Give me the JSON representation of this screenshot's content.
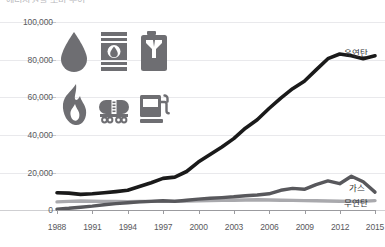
{
  "title_truncated": "에너지원별 소비 추이",
  "yaxis": {
    "ticks": [
      "100,000",
      "80,000",
      "60,000",
      "40,000",
      "20,000",
      "0"
    ],
    "values": [
      100000,
      80000,
      60000,
      40000,
      20000,
      0
    ]
  },
  "xaxis": {
    "ticks": [
      "1988",
      "1991",
      "1994",
      "1997",
      "2000",
      "2003",
      "2006",
      "2009",
      "2012",
      "2015"
    ]
  },
  "legend": {
    "bituminous": "유연탄",
    "gas": "가스",
    "anthracite": "무연탄"
  },
  "colors": {
    "bituminous": "#1a1a1a",
    "gas": "#58585c",
    "anthracite": "#a9a9ad",
    "grid": "#e9e9ec",
    "axis": "#9b9b9f",
    "icon": "#6e6e72",
    "text": "#59595d"
  },
  "icons": {
    "row1": [
      "oil-droplet-icon",
      "oil-barrel-icon",
      "jerry-can-icon"
    ],
    "row2": [
      "flame-icon",
      "tanker-truck-icon",
      "fuel-pump-icon"
    ]
  },
  "chart_data": {
    "type": "line",
    "title": "에너지원별 소비 추이",
    "xlabel": "",
    "ylabel": "",
    "xlim": [
      1988,
      2015
    ],
    "ylim": [
      0,
      100000
    ],
    "ytick_step": 20000,
    "grid": true,
    "legend_position": "right-inline",
    "x": [
      1988,
      1989,
      1990,
      1991,
      1992,
      1993,
      1994,
      1995,
      1996,
      1997,
      1998,
      1999,
      2000,
      2001,
      2002,
      2003,
      2004,
      2005,
      2006,
      2007,
      2008,
      2009,
      2010,
      2011,
      2012,
      2013,
      2014,
      2015
    ],
    "series": [
      {
        "name": "유연탄",
        "color": "#1a1a1a",
        "values": [
          9200,
          9000,
          8300,
          8600,
          9200,
          9800,
          10500,
          12500,
          14500,
          16800,
          17500,
          20500,
          25500,
          29500,
          33500,
          38000,
          43500,
          48000,
          54000,
          59500,
          64500,
          68500,
          74500,
          80500,
          83000,
          82000,
          80500,
          82000
        ]
      },
      {
        "name": "가스",
        "color": "#58585c",
        "values": [
          500,
          900,
          1500,
          2100,
          2800,
          3400,
          3900,
          4300,
          4600,
          4900,
          4600,
          5200,
          5800,
          6200,
          6600,
          7000,
          7600,
          8000,
          8600,
          10500,
          11500,
          11000,
          13500,
          15500,
          14000,
          18000,
          15000,
          9500
        ]
      },
      {
        "name": "무연탄",
        "color": "#a9a9ad",
        "values": [
          4300,
          4600,
          4800,
          4700,
          4600,
          4500,
          4400,
          4500,
          4600,
          4700,
          4700,
          4800,
          4900,
          5000,
          5100,
          5200,
          5300,
          5400,
          5300,
          5200,
          5100,
          5000,
          4900,
          4800,
          4700,
          4600,
          4700,
          5000
        ]
      }
    ]
  }
}
